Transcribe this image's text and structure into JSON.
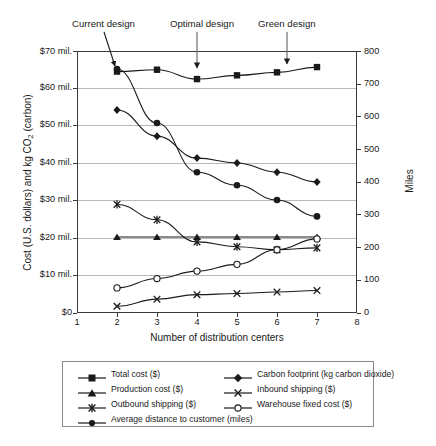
{
  "chart_data": {
    "type": "line",
    "title": "",
    "xlabel": "Number of distribution centers",
    "ylabel_left": "Cost (U.S. dollars) and kg CO2 (carbon)",
    "ylabel_right": "Miles",
    "x": [
      2,
      3,
      4,
      5,
      6,
      7
    ],
    "xlim": [
      1,
      8
    ],
    "xticks": [
      "1",
      "2",
      "3",
      "4",
      "5",
      "6",
      "7",
      "8"
    ],
    "ylim_left": [
      0,
      70000000
    ],
    "yticks_left": [
      "$0",
      "$10 mil.",
      "$20 mil.",
      "$30 mil.",
      "$40 mil.",
      "$50 mil.",
      "$60 mil.",
      "$70 mil."
    ],
    "ylim_right": [
      0,
      800
    ],
    "yticks_right": [
      "0",
      "100",
      "200",
      "300",
      "400",
      "500",
      "600",
      "700",
      "800"
    ],
    "grid": true,
    "legend_position": "below",
    "series": [
      {
        "name": "Total cost ($)",
        "marker": "square",
        "axis": "left",
        "values": [
          64.5,
          65.0,
          62.5,
          63.5,
          64.3,
          65.7
        ],
        "units": "million USD"
      },
      {
        "name": "Production cost ($)",
        "marker": "triangle",
        "axis": "left",
        "values": [
          20.3,
          20.3,
          20.3,
          20.3,
          20.3,
          20.3
        ],
        "units": "million USD"
      },
      {
        "name": "Outbound shipping ($)",
        "marker": "asterisk",
        "axis": "left",
        "values": [
          29.0,
          24.9,
          19.0,
          17.7,
          16.9,
          17.4
        ],
        "units": "million USD"
      },
      {
        "name": "Average distance to customer (miles)",
        "marker": "circle-filled",
        "axis": "right",
        "values": [
          745,
          580,
          430,
          390,
          345,
          295
        ],
        "units": "miles"
      },
      {
        "name": "Carbon footprint (kg carbon dioxide)",
        "marker": "diamond",
        "axis": "right",
        "values": [
          620,
          540,
          473,
          458,
          430,
          400
        ],
        "units": "kg CO2"
      },
      {
        "name": "Inbound shipping ($)",
        "marker": "cross",
        "axis": "left",
        "values": [
          1.8,
          3.7,
          4.9,
          5.2,
          5.6,
          6.0
        ],
        "units": "million USD"
      },
      {
        "name": "Warehouse fixed cost ($)",
        "marker": "circle-open",
        "axis": "left",
        "values": [
          6.7,
          9.2,
          11.2,
          13.0,
          16.9,
          19.8
        ],
        "units": "million USD"
      }
    ],
    "annotations": [
      {
        "label": "Current design",
        "points_to_x": 2
      },
      {
        "label": "Optimal design",
        "points_to_x": 4
      },
      {
        "label": "Green design",
        "points_to_x": 6
      }
    ]
  },
  "axes": {
    "left_ticks": [
      "$70 mil.",
      "$60 mil.",
      "$50 mil.",
      "$40 mil.",
      "$30 mil.",
      "$20 mil.",
      "$10 mil.",
      "$0"
    ],
    "right_ticks": [
      "800",
      "700",
      "600",
      "500",
      "400",
      "300",
      "200",
      "100",
      "0"
    ],
    "x_ticks": [
      "1",
      "2",
      "3",
      "4",
      "5",
      "6",
      "7",
      "8"
    ],
    "x_title": "Number of distribution centers",
    "y_title_left_a": "Cost (U.S. dollars) and kg CO",
    "y_title_left_sub": "2",
    "y_title_left_b": " (carbon)",
    "y_title_right": "Miles"
  },
  "annotations": {
    "current": "Current design",
    "optimal": "Optimal design",
    "green": "Green design"
  },
  "legend": {
    "items": [
      {
        "label": "Total cost ($)",
        "marker": "square"
      },
      {
        "label": "Carbon footprint (kg carbon dioxide)",
        "marker": "diamond"
      },
      {
        "label": "Production cost ($)",
        "marker": "triangle"
      },
      {
        "label": "Inbound shipping ($)",
        "marker": "cross"
      },
      {
        "label": "Outbound shipping ($)",
        "marker": "asterisk"
      },
      {
        "label": "Warehouse fixed cost ($)",
        "marker": "circle-open"
      },
      {
        "label": "Average distance to customer (miles)",
        "marker": "circle-filled"
      }
    ]
  },
  "colors": {
    "line": "#1a1a1a",
    "grid": "#b9b9b9",
    "frame": "#3a3a3a",
    "text": "#1a1a1a",
    "background": "#ffffff"
  }
}
